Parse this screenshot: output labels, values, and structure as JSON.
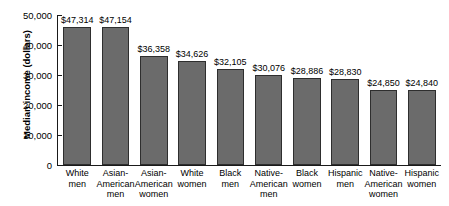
{
  "chart_data": {
    "type": "bar",
    "title": "",
    "xlabel": "",
    "ylabel": "Median income (dollars)",
    "ylim": [
      0,
      50000
    ],
    "ytick_values": [
      0,
      10000,
      20000,
      30000,
      40000,
      50000
    ],
    "ytick_labels": [
      "0",
      "10,000",
      "20,000",
      "30,000",
      "40,000",
      "50,000"
    ],
    "grid": false,
    "legend": null,
    "bar_color": "#6b6b6b",
    "bar_border_color": "#2e2e2e",
    "categories": [
      "White men",
      "Asian-American men",
      "Asian-American women",
      "White women",
      "Black men",
      "Native-American men",
      "Black women",
      "Hispanic men",
      "Native-American women",
      "Hispanic women"
    ],
    "category_lines": [
      [
        "White",
        "men"
      ],
      [
        "Asian-",
        "American",
        "men"
      ],
      [
        "Asian-",
        "American",
        "women"
      ],
      [
        "White",
        "women"
      ],
      [
        "Black",
        "men"
      ],
      [
        "Native-",
        "American",
        "men"
      ],
      [
        "Black",
        "women"
      ],
      [
        "Hispanic",
        "men"
      ],
      [
        "Native-",
        "American",
        "women"
      ],
      [
        "Hispanic",
        "women"
      ]
    ],
    "values": [
      47314,
      47154,
      36358,
      34626,
      32105,
      30076,
      28886,
      28830,
      24850,
      24840
    ],
    "value_labels": [
      "$47,314",
      "$47,154",
      "$36,358",
      "$34,626",
      "$32,105",
      "$30,076",
      "$28,886",
      "$28,830",
      "$24,850",
      "$24,840"
    ]
  }
}
